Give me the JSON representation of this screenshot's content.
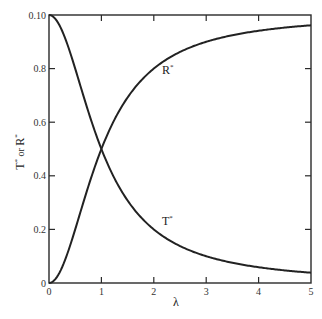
{
  "chart_data": {
    "type": "line",
    "title": "",
    "xlabel": "λ",
    "ylabel": "T* or R*",
    "xlim": [
      0,
      5
    ],
    "ylim": [
      0,
      1.0
    ],
    "grid": false,
    "legend": "none (inline curve labels)",
    "x_ticks": [
      "0",
      "1",
      "2",
      "3",
      "4",
      "5"
    ],
    "y_ticks": [
      "0",
      "0.2",
      "0.4",
      "0.6",
      "0.8",
      "0.10"
    ],
    "x": [
      0,
      0.25,
      0.5,
      0.75,
      1,
      1.25,
      1.5,
      2,
      2.5,
      3,
      3.5,
      4,
      4.5,
      5
    ],
    "series": [
      {
        "name": "T*",
        "values": [
          1.0,
          0.941,
          0.8,
          0.64,
          0.5,
          0.39,
          0.308,
          0.2,
          0.138,
          0.1,
          0.075,
          0.059,
          0.047,
          0.038
        ]
      },
      {
        "name": "R*",
        "values": [
          0.0,
          0.059,
          0.2,
          0.36,
          0.5,
          0.61,
          0.692,
          0.8,
          0.862,
          0.9,
          0.925,
          0.941,
          0.953,
          0.962
        ]
      }
    ],
    "annotations": [
      {
        "text": "R",
        "sup": "*",
        "near_x": 1.3,
        "near_y": 0.77
      },
      {
        "text": "T",
        "sup": "*",
        "near_x": 1.3,
        "near_y": 0.2
      }
    ]
  },
  "labels": {
    "xlabel": "λ",
    "ylabel_main1": "T",
    "ylabel_or": " or ",
    "ylabel_main2": "R",
    "sup": "*",
    "r_label": "R",
    "t_label": "T"
  }
}
